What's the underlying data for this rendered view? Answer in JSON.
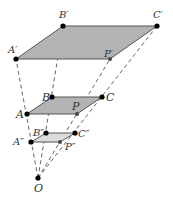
{
  "diagram": {
    "center": {
      "name": "O",
      "label": "O",
      "x": 38,
      "y": 178
    },
    "colors": {
      "fill_large": "#b3b3b3",
      "fill_middle": "#b3b3b3",
      "fill_small": "#dcdcdc",
      "edge": "#555555",
      "dash": "#555555",
      "point": "#000000",
      "label": "#333333"
    },
    "parallelograms": [
      {
        "id": "image-large",
        "vertices": [
          {
            "name": "A'",
            "label": "A′",
            "x": 16,
            "y": 59
          },
          {
            "name": "B'",
            "label": "B′",
            "x": 63,
            "y": 26
          },
          {
            "name": "C'",
            "label": "C′",
            "x": 157,
            "y": 26
          },
          {
            "name": "P'",
            "label": "P′",
            "x": 110,
            "y": 59
          }
        ]
      },
      {
        "id": "original",
        "vertices": [
          {
            "name": "A",
            "label": "A",
            "x": 27,
            "y": 114
          },
          {
            "name": "B",
            "label": "B",
            "x": 52,
            "y": 97
          },
          {
            "name": "C",
            "label": "C",
            "x": 102,
            "y": 97
          },
          {
            "name": "P",
            "label": "P",
            "x": 77,
            "y": 114
          }
        ]
      },
      {
        "id": "image-small",
        "vertices": [
          {
            "name": "A''",
            "label": "A″",
            "x": 31,
            "y": 142
          },
          {
            "name": "B''",
            "label": "B″",
            "x": 46,
            "y": 133
          },
          {
            "name": "C''",
            "label": "C″",
            "x": 75,
            "y": 133
          },
          {
            "name": "P''",
            "label": "P″",
            "x": 60,
            "y": 142
          }
        ]
      }
    ],
    "labels": [
      {
        "text": "A′",
        "x": 8,
        "y": 53
      },
      {
        "text": "B′",
        "x": 59,
        "y": 18
      },
      {
        "text": "C′",
        "x": 153,
        "y": 18
      },
      {
        "text": "P′",
        "x": 104,
        "y": 57
      },
      {
        "text": "B",
        "x": 42,
        "y": 101
      },
      {
        "text": "A",
        "x": 16,
        "y": 118
      },
      {
        "text": "C",
        "x": 106,
        "y": 101
      },
      {
        "text": "P",
        "x": 72,
        "y": 110
      },
      {
        "text": "B″",
        "x": 33,
        "y": 136
      },
      {
        "text": "A″",
        "x": 13,
        "y": 145
      },
      {
        "text": "C″",
        "x": 78,
        "y": 137
      },
      {
        "text": "P″",
        "x": 65,
        "y": 150
      },
      {
        "text": "O",
        "x": 34,
        "y": 192
      }
    ]
  }
}
